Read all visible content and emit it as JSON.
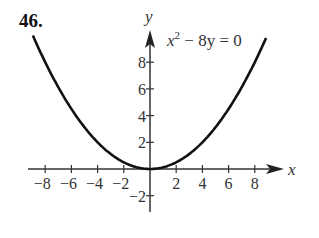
{
  "problem_number": "46.",
  "chart_data": {
    "type": "line",
    "title": "",
    "equation": "x^2 - 8y = 0",
    "equation_parts": {
      "base": "x",
      "exp": "2",
      "rest": " − 8y = 0"
    },
    "xlabel": "x",
    "ylabel": "y",
    "xlim": [
      -9,
      10
    ],
    "ylim": [
      -3,
      10
    ],
    "x_ticks": [
      -8,
      -6,
      -4,
      -2,
      2,
      4,
      6,
      8
    ],
    "x_tick_labels": [
      "−8",
      "−6",
      "−4",
      "−2",
      "2",
      "4",
      "6",
      "8"
    ],
    "y_ticks": [
      -2,
      2,
      4,
      6,
      8
    ],
    "y_tick_labels": [
      "−2",
      "2",
      "4",
      "6",
      "8"
    ],
    "grid": false,
    "series": [
      {
        "name": "x^2 - 8y = 0",
        "function": "y = x^2/8",
        "x": [
          -8.94,
          -8,
          -6,
          -4,
          -2,
          0,
          2,
          4,
          6,
          8,
          8.94
        ],
        "y": [
          10,
          8,
          4.5,
          2,
          0.5,
          0,
          0.5,
          2,
          4.5,
          8,
          10
        ]
      }
    ]
  }
}
